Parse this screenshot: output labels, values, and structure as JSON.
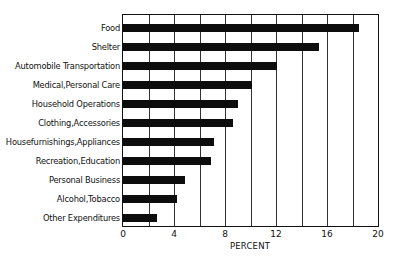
{
  "chart_data": {
    "type": "bar",
    "orientation": "horizontal",
    "title": "",
    "xlabel": "PERCENT",
    "ylabel": "",
    "xlim": [
      0,
      20
    ],
    "x_ticks": [
      0,
      4,
      8,
      12,
      16,
      20
    ],
    "gridlines_every": 2,
    "grid": true,
    "legend": null,
    "categories": [
      "Food",
      "Shelter",
      "Automobile Transportation",
      "Medical,Personal Care",
      "Household Operations",
      "Clothing,Accessories",
      "Housefurnishings,Appliances",
      "Recreation,Education",
      "Personal Business",
      "Alcohol,Tobacco",
      "Other Expenditures"
    ],
    "values": [
      18.5,
      15.4,
      12.1,
      10.1,
      9.0,
      8.6,
      7.1,
      6.9,
      4.9,
      4.2,
      2.7
    ]
  },
  "axis": {
    "tick_labels": [
      "0",
      "4",
      "8",
      "12",
      "16",
      "20"
    ]
  },
  "colors": {
    "bar": "#0d0d0d",
    "grid": "#333333",
    "background": "#ffffff"
  }
}
